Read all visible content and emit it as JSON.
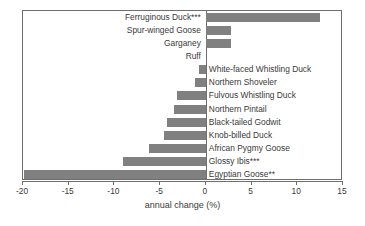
{
  "chart_data": {
    "type": "bar",
    "orientation": "horizontal",
    "title": "",
    "xlabel": "annual change (%)",
    "ylabel": "",
    "xlim": [
      -20,
      15
    ],
    "xticks": [
      -20,
      -15,
      -10,
      -5,
      0,
      5,
      10,
      15
    ],
    "xticklabels": [
      "-20",
      "-15",
      "-10",
      "-5",
      "0",
      "5",
      "10",
      "15"
    ],
    "grid": false,
    "legend": null,
    "bar_color": "#808080",
    "axis_color": "#6e6e6e",
    "categories": [
      "Ferruginous Duck***",
      "Spur-winged Goose",
      "Garganey",
      "Ruff",
      "White-faced Whistling Duck",
      "Northern Shoveler",
      "Fulvous Whistling Duck",
      "Northern Pintail",
      "Black-tailed Godwit",
      "Knob-billed Duck",
      "African Pygmy Goose",
      "Glossy Ibis***",
      "Egyptian Goose**"
    ],
    "values": [
      12.5,
      2.8,
      2.8,
      0.0,
      -0.8,
      -1.2,
      -3.2,
      -3.5,
      -4.2,
      -4.6,
      -6.2,
      -9.1,
      -19.9
    ]
  }
}
